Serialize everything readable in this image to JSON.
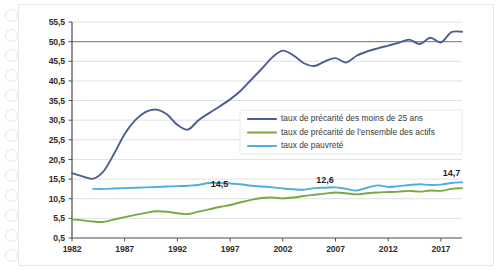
{
  "chart_data": {
    "type": "line",
    "title": "",
    "xlabel": "",
    "ylabel": "",
    "xlim": [
      1982,
      2019
    ],
    "ylim": [
      0.5,
      55.5
    ],
    "grid": true,
    "legend_position": "center-right",
    "xticks": [
      "1982",
      "1987",
      "1992",
      "1997",
      "2002",
      "2007",
      "2012",
      "2017"
    ],
    "xtick_values": [
      1982,
      1987,
      1992,
      1997,
      2002,
      2007,
      2012,
      2017
    ],
    "yticks": [
      "0,5",
      "5,5",
      "10,5",
      "15,5",
      "20,5",
      "25,5",
      "30,5",
      "35,5",
      "40,5",
      "45,5",
      "50,5",
      "55,5"
    ],
    "ytick_values": [
      0.5,
      5.5,
      10.5,
      15.5,
      20.5,
      25.5,
      30.5,
      35.5,
      40.5,
      45.5,
      50.5,
      55.5
    ],
    "emphasized_gridline": 50.5,
    "annotations": [
      {
        "text": "14,5",
        "x": 1996,
        "y": 13.6,
        "series": "taux de pauvreté"
      },
      {
        "text": "12,6",
        "x": 2006,
        "y": 14.5,
        "series": "taux de pauvreté"
      },
      {
        "text": "14,7",
        "x": 2018,
        "y": 16.4,
        "series": "taux de pauvreté"
      }
    ],
    "series": [
      {
        "name": "taux de précarité des moins de 25 ans",
        "color": "#4d5d93",
        "x": [
          1982,
          1983,
          1984,
          1985,
          1986,
          1987,
          1988,
          1989,
          1990,
          1991,
          1992,
          1993,
          1994,
          1995,
          1996,
          1997,
          1998,
          1999,
          2000,
          2001,
          2002,
          2003,
          2004,
          2005,
          2006,
          2007,
          2008,
          2009,
          2010,
          2011,
          2012,
          2013,
          2014,
          2015,
          2016,
          2017,
          2018,
          2019
        ],
        "values": [
          17.0,
          16.2,
          15.6,
          17.5,
          22.0,
          27.0,
          30.5,
          32.6,
          33.2,
          32.0,
          29.3,
          28.1,
          30.5,
          32.3,
          34.0,
          35.8,
          38.0,
          40.8,
          43.6,
          46.5,
          48.2,
          47.0,
          45.0,
          44.3,
          45.5,
          46.3,
          45.2,
          46.9,
          48.0,
          48.8,
          49.5,
          50.2,
          51.0,
          49.9,
          51.5,
          50.3,
          52.9,
          53.0
        ]
      },
      {
        "name": "taux de précarité de l'ensemble des actifs",
        "color": "#7ba83f",
        "x": [
          1982,
          1983,
          1984,
          1985,
          1986,
          1987,
          1988,
          1989,
          1990,
          1991,
          1992,
          1993,
          1994,
          1995,
          1996,
          1997,
          1998,
          1999,
          2000,
          2001,
          2002,
          2003,
          2004,
          2005,
          2006,
          2007,
          2008,
          2009,
          2010,
          2011,
          2012,
          2013,
          2014,
          2015,
          2016,
          2017,
          2018,
          2019
        ],
        "values": [
          5.2,
          5.0,
          4.7,
          4.6,
          5.2,
          5.8,
          6.4,
          6.9,
          7.3,
          7.2,
          6.8,
          6.6,
          7.2,
          7.8,
          8.4,
          8.9,
          9.6,
          10.2,
          10.7,
          10.8,
          10.6,
          10.8,
          11.2,
          11.5,
          11.8,
          12.1,
          11.9,
          11.6,
          11.9,
          12.1,
          12.2,
          12.3,
          12.5,
          12.3,
          12.6,
          12.5,
          13.0,
          13.2
        ]
      },
      {
        "name": "taux de pauvreté",
        "color": "#4eaee0",
        "x": [
          1984,
          1985,
          1986,
          1987,
          1988,
          1989,
          1990,
          1991,
          1992,
          1993,
          1994,
          1995,
          1996,
          1997,
          1998,
          1999,
          2000,
          2001,
          2002,
          2003,
          2004,
          2005,
          2006,
          2007,
          2008,
          2009,
          2010,
          2011,
          2012,
          2013,
          2014,
          2015,
          2016,
          2017,
          2018,
          2019
        ],
        "values": [
          13.0,
          13.0,
          13.1,
          13.2,
          13.3,
          13.4,
          13.5,
          13.6,
          13.7,
          13.8,
          14.0,
          14.5,
          14.5,
          14.4,
          14.2,
          13.8,
          13.6,
          13.4,
          13.1,
          12.9,
          12.8,
          13.2,
          13.3,
          13.4,
          13.0,
          12.6,
          13.3,
          13.9,
          13.5,
          13.7,
          14.0,
          14.2,
          14.0,
          14.1,
          14.5,
          14.7
        ]
      }
    ]
  },
  "legend": {
    "items": [
      {
        "label": "taux de précarité des moins de 25 ans",
        "color": "#4d5d93"
      },
      {
        "label": "taux de précarité de l'ensemble des actifs",
        "color": "#7ba83f"
      },
      {
        "label": "taux de pauvreté",
        "color": "#4eaee0"
      }
    ]
  }
}
